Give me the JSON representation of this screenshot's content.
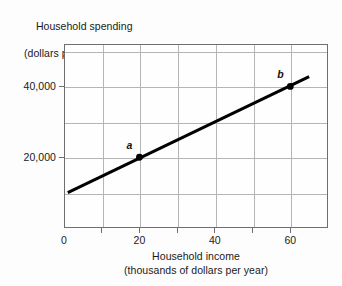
{
  "chart_data": {
    "type": "line",
    "title": "",
    "xlabel": "Household income (thousands of dollars per year)",
    "ylabel": "Household spending (dollars per year)",
    "ylabel_line1": "Household spending",
    "ylabel_line2": "(dollars per year)",
    "xlabel_line1": "Household income",
    "xlabel_line2": "(thousands of dollars per year)",
    "xlim": [
      0,
      70
    ],
    "ylim": [
      0,
      52000
    ],
    "grid": true,
    "legend": "none",
    "x_ticks": [
      {
        "value": 0,
        "label": "0"
      },
      {
        "value": 20,
        "label": "20"
      },
      {
        "value": 40,
        "label": "40"
      },
      {
        "value": 60,
        "label": "60"
      }
    ],
    "y_ticks": [
      {
        "value": 20000,
        "label": "20,000"
      },
      {
        "value": 40000,
        "label": "40,000"
      }
    ],
    "x_gridlines": [
      10,
      20,
      30,
      40,
      50,
      60
    ],
    "y_gridlines": [
      10000,
      20000,
      30000,
      40000,
      50000
    ],
    "series": [
      {
        "name": "spending line",
        "color": "#000000",
        "x": [
          1.0,
          65.0
        ],
        "values": [
          10000,
          42800
        ],
        "line_width_px": 3
      }
    ],
    "points": [
      {
        "label": "a",
        "x": 20,
        "y": 20000,
        "label_position": "upper-left"
      },
      {
        "label": "b",
        "x": 60,
        "y": 40000,
        "label_position": "upper-left"
      }
    ],
    "colors": {
      "line": "#000000",
      "grid": "#b5b5b5",
      "axis": "#6e6e6e",
      "text": "#1a1a1a",
      "background": "#fdfdfd"
    }
  }
}
